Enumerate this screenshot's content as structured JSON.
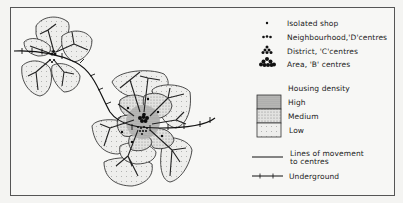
{
  "diagram": {
    "legend": {
      "symbols": [
        {
          "icon": "single-dot-icon",
          "label": "Isolated shop"
        },
        {
          "icon": "dot-row-icon",
          "label": "Neighbourhood,'D'centres"
        },
        {
          "icon": "dot-triangle-icon",
          "label": "District, 'C'centres"
        },
        {
          "icon": "dot-cluster-icon",
          "label": "Area, 'B' centres"
        }
      ],
      "density_title": "Housing density",
      "density_levels": [
        {
          "label": "High",
          "fill": "#b8b8b8"
        },
        {
          "label": "Medium",
          "fill": "#d8d8d6"
        },
        {
          "label": "Low",
          "fill": "#eeeeec"
        }
      ],
      "lines": [
        {
          "icon": "plain-line-icon",
          "label_line1": "Lines of movement",
          "label_line2": "to centres"
        },
        {
          "icon": "tick-line-icon",
          "label": "Underground"
        }
      ]
    },
    "colors": {
      "ink": "#1a1a1a",
      "low_density": "#eeeeec",
      "medium_density": "#d8d8d6",
      "high_density": "#b8b8b8",
      "background": "#f7f7f5"
    }
  }
}
